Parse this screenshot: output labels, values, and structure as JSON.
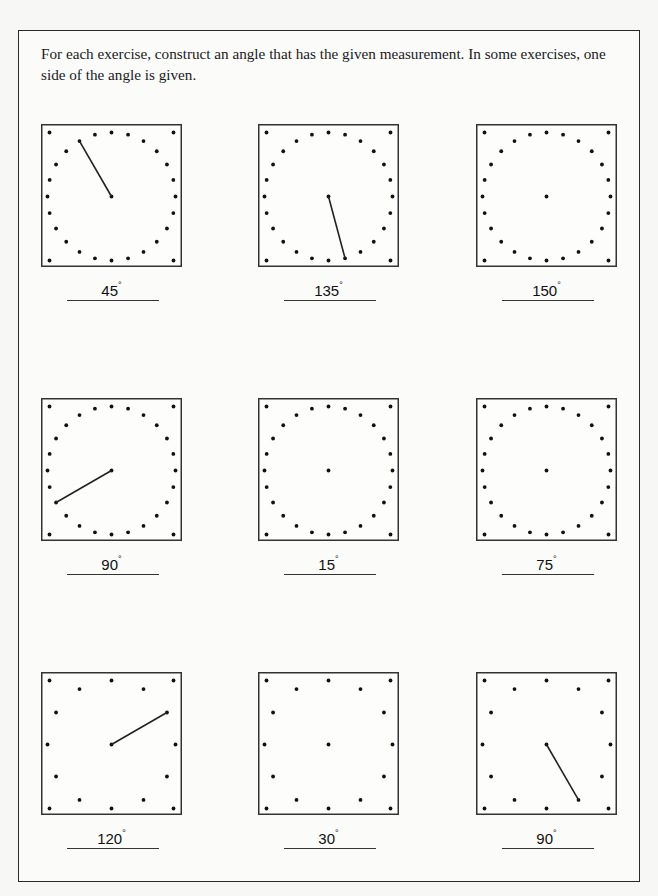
{
  "instructions": "For each exercise, construct an angle that has the given measurement. In some exercises, one side of the angle is given.",
  "degree_symbol": "°",
  "exercises": [
    {
      "measure": "45",
      "grid": "24-point",
      "given_side_angle_deg": 120,
      "has_given_side": true
    },
    {
      "measure": "135",
      "grid": "24-point",
      "given_side_angle_deg": -75,
      "has_given_side": true
    },
    {
      "measure": "150",
      "grid": "24-point",
      "given_side_angle_deg": null,
      "has_given_side": false
    },
    {
      "measure": "90",
      "grid": "24-point",
      "given_side_angle_deg": 210,
      "has_given_side": true
    },
    {
      "measure": "15",
      "grid": "24-point",
      "given_side_angle_deg": null,
      "has_given_side": false
    },
    {
      "measure": "75",
      "grid": "24-point",
      "given_side_angle_deg": null,
      "has_given_side": false
    },
    {
      "measure": "120",
      "grid": "12-point",
      "given_side_angle_deg": 30,
      "has_given_side": true
    },
    {
      "measure": "30",
      "grid": "12-point",
      "given_side_angle_deg": null,
      "has_given_side": false
    },
    {
      "measure": "90",
      "grid": "12-point",
      "given_side_angle_deg": -60,
      "has_given_side": true
    }
  ]
}
